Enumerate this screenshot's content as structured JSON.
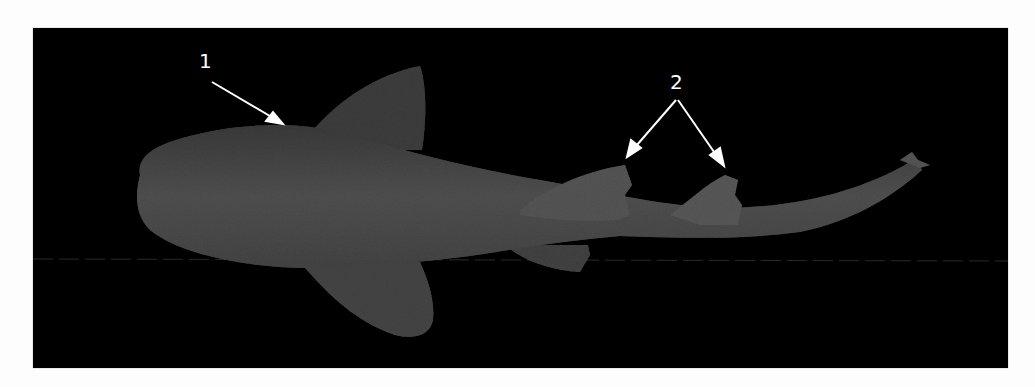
{
  "figure": {
    "background_color": "#000000",
    "specimen_color": "#4a4a4a",
    "annotations": [
      {
        "id": "label-1",
        "text": "1",
        "x": 199,
        "y": 51,
        "arrows": [
          {
            "from": [
              212,
              82
            ],
            "to": [
              283,
              124
            ]
          }
        ]
      },
      {
        "id": "label-2",
        "text": "2",
        "x": 670,
        "y": 72,
        "arrows": [
          {
            "from": [
              676,
              100
            ],
            "to": [
              627,
              157
            ]
          },
          {
            "from": [
              678,
              100
            ],
            "to": [
              724,
              166
            ]
          }
        ]
      }
    ]
  }
}
